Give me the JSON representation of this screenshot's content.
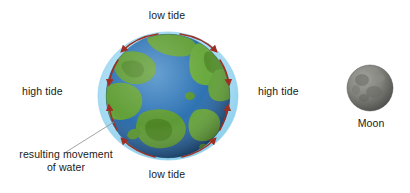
{
  "diagram": {
    "background_color": "#ffffff",
    "labels": {
      "low_tide_top": "low tide",
      "low_tide_bottom": "low tide",
      "high_tide_left": "high tide",
      "high_tide_right": "high tide",
      "movement_note_line1": "resulting movement",
      "movement_note_line2": "of water",
      "moon": "Moon"
    },
    "earth": {
      "name": "earth-globe",
      "ocean_color": "#2a6fb0",
      "ocean_deep_color": "#1b4f86",
      "land_color": "#5f9e34",
      "land_dark_color": "#47801f",
      "water_bulge_color": "#a8dcf2",
      "water_bulge_edge_color": "#7cc8e8"
    },
    "moon": {
      "name": "moon-sphere",
      "body_color": "#7c7c79",
      "shadow_color": "#4e4e4c",
      "highlight_color": "#9b9b96"
    },
    "arrows": {
      "name": "water-movement-arrows",
      "color": "#9e2f22",
      "count": 8,
      "description": "curved arrows showing water flowing from low tide regions toward high tide bulges"
    },
    "leader_line": {
      "name": "annotation-leader-line",
      "color": "#9a9a9a"
    }
  }
}
